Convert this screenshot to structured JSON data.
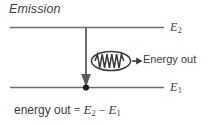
{
  "figure": {
    "title": "Emission",
    "levels": [
      {
        "id": "upper",
        "symbol": "E",
        "subscript": "2",
        "label": "E2"
      },
      {
        "id": "lower",
        "symbol": "E",
        "subscript": "1",
        "label": "E1"
      }
    ],
    "photon": {
      "caption": "Energy out",
      "icon": "photon-wave-icon",
      "arrow": "arrow-right-icon",
      "wave_peaks": 4
    },
    "transition": {
      "direction": "downward",
      "arrow": "arrow-down-icon",
      "endpoint_marker": "electron-dot"
    },
    "equation": {
      "left_words": "energy out",
      "equals": "=",
      "term1_symbol": "E",
      "term1_subscript": "2",
      "minus": "−",
      "term2_symbol": "E",
      "term2_subscript": "1",
      "full_text": "energy out = E2 − E1"
    },
    "colors": {
      "line": "#6e6e6e",
      "text": "#3b3b3b",
      "arrow": "#4a4a4a",
      "background": "#ffffff"
    }
  }
}
